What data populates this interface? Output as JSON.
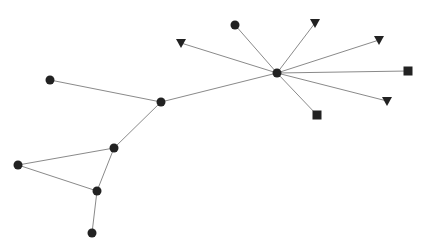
{
  "graph": {
    "node_color": "#222222",
    "edge_color": "#8a8a8a",
    "nodes": [
      {
        "id": "hub",
        "shape": "circle"
      },
      {
        "id": "c1",
        "shape": "circle"
      },
      {
        "id": "t1",
        "shape": "triangle"
      },
      {
        "id": "t2",
        "shape": "triangle"
      },
      {
        "id": "t3",
        "shape": "triangle"
      },
      {
        "id": "s1",
        "shape": "square"
      },
      {
        "id": "t4",
        "shape": "triangle"
      },
      {
        "id": "s2",
        "shape": "square"
      },
      {
        "id": "n1",
        "shape": "circle"
      },
      {
        "id": "n2",
        "shape": "circle"
      },
      {
        "id": "n3",
        "shape": "circle"
      },
      {
        "id": "n4",
        "shape": "circle"
      },
      {
        "id": "n5",
        "shape": "circle"
      },
      {
        "id": "n6",
        "shape": "circle"
      }
    ],
    "edges": [
      [
        "hub",
        "c1"
      ],
      [
        "hub",
        "t1"
      ],
      [
        "hub",
        "t2"
      ],
      [
        "hub",
        "t3"
      ],
      [
        "hub",
        "s1"
      ],
      [
        "hub",
        "t4"
      ],
      [
        "hub",
        "s2"
      ],
      [
        "hub",
        "n1"
      ],
      [
        "n1",
        "n2"
      ],
      [
        "n1",
        "n3"
      ],
      [
        "n3",
        "n4"
      ],
      [
        "n3",
        "n5"
      ],
      [
        "n4",
        "n5"
      ],
      [
        "n5",
        "n6"
      ]
    ]
  }
}
